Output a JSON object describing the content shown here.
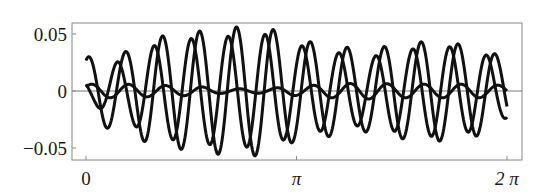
{
  "chart_data": {
    "type": "line",
    "title": "",
    "xlabel": "",
    "ylabel": "",
    "xlim": [
      0,
      6.283185
    ],
    "ylim": [
      -0.06,
      0.06
    ],
    "grid": false,
    "legend": null,
    "x_ticks": [
      {
        "value": 0,
        "label": "0"
      },
      {
        "value": 3.141593,
        "label": "π"
      },
      {
        "value": 6.283185,
        "label": "2 π"
      }
    ],
    "y_ticks": [
      {
        "value": 0.05,
        "label": "0.05"
      },
      {
        "value": 0,
        "label": "0"
      },
      {
        "value": -0.05,
        "label": "−0.05"
      }
    ],
    "zero_line": true,
    "line_color": "#111111",
    "series": [
      {
        "name": "curve-a",
        "description": "large-amplitude oscillation, ~11.4 cycles over [0, 2π], amplitude envelope rising to ~0.057 near t≈2.7 then decaying to ~0.03",
        "x": [
          0,
          0.5236,
          1.0472,
          1.5708,
          2.0944,
          2.618,
          3.1416,
          3.6652,
          4.1888,
          4.7124,
          5.236,
          5.7596,
          6.2832
        ],
        "envelope": [
          0.03,
          0.034,
          0.048,
          0.052,
          0.056,
          0.057,
          0.045,
          0.04,
          0.036,
          0.042,
          0.044,
          0.04,
          0.03
        ],
        "frequency": 11.4,
        "phase": 1.1
      },
      {
        "name": "curve-b",
        "description": "large-amplitude oscillation, same frequency as curve-a, leading by ~8px (≈0.12 rad)",
        "x": [
          0,
          0.5236,
          1.0472,
          1.5708,
          2.0944,
          2.618,
          3.1416,
          3.6652,
          4.1888,
          4.7124,
          5.236,
          5.7596,
          6.2832
        ],
        "envelope": [
          0.01,
          0.026,
          0.04,
          0.046,
          0.048,
          0.05,
          0.04,
          0.034,
          0.03,
          0.036,
          0.04,
          0.036,
          0.024
        ],
        "frequency": 11.4,
        "phase": 2.5
      },
      {
        "name": "curve-c",
        "description": "small-amplitude oscillation around zero, ~0.004–0.006",
        "x": [
          0,
          0.5236,
          1.0472,
          1.5708,
          2.0944,
          2.618,
          3.1416,
          3.6652,
          4.1888,
          4.7124,
          5.236,
          5.7596,
          6.2832
        ],
        "envelope": [
          0.006,
          0.006,
          0.005,
          0.004,
          0.002,
          0.002,
          0.004,
          0.006,
          0.007,
          0.006,
          0.006,
          0.006,
          0.005
        ],
        "frequency": 11.4,
        "phase": 0.6
      }
    ]
  },
  "plot": {
    "frame": {
      "left": 72,
      "top": 23,
      "right": 522,
      "bottom": 160
    },
    "x_axis_px": {
      "zero": 86,
      "two_pi": 507
    },
    "y_axis_px": {
      "zero": 91,
      "per_unit": 1140
    }
  }
}
